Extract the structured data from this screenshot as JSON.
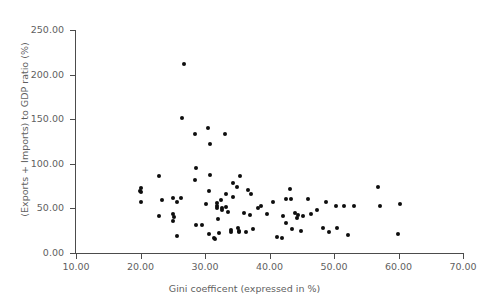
{
  "chart_data": {
    "type": "scatter",
    "title": "",
    "xlabel": "Gini coefficent (expressed in %)",
    "ylabel": "(Exports + Imports) to GDP ratio (%)",
    "xlim": [
      10.0,
      70.0
    ],
    "ylim": [
      0.0,
      250.0
    ],
    "xticks": [
      10.0,
      20.0,
      30.0,
      40.0,
      50.0,
      60.0,
      70.0
    ],
    "yticks": [
      0.0,
      50.0,
      100.0,
      150.0,
      200.0,
      250.0
    ],
    "xtick_labels": [
      "10.00",
      "20.00",
      "30.00",
      "40.00",
      "50.00",
      "60.00",
      "70.00"
    ],
    "ytick_labels": [
      "0.00",
      "50.00",
      "100.00",
      "150.00",
      "200.00",
      "250.00"
    ],
    "grid": false,
    "legend": false,
    "marker": "filled-circle",
    "marker_color": "#0d0d0d",
    "axis_color": "#4c4c4c",
    "text_color": "#5f5f5f",
    "background_color": "#ffffff",
    "n_points": 88,
    "points": [
      {
        "x": 19.9,
        "y": 70.0
      },
      {
        "x": 20.0,
        "y": 72.5
      },
      {
        "x": 20.1,
        "y": 68.0
      },
      {
        "x": 20.1,
        "y": 57.5
      },
      {
        "x": 22.9,
        "y": 86.5
      },
      {
        "x": 22.8,
        "y": 41.5
      },
      {
        "x": 25.0,
        "y": 62.0
      },
      {
        "x": 25.1,
        "y": 44.0
      },
      {
        "x": 25.2,
        "y": 40.5
      },
      {
        "x": 25.1,
        "y": 36.0
      },
      {
        "x": 25.6,
        "y": 18.5
      },
      {
        "x": 25.7,
        "y": 57.0
      },
      {
        "x": 26.8,
        "y": 212.0
      },
      {
        "x": 26.5,
        "y": 151.5
      },
      {
        "x": 28.5,
        "y": 133.0
      },
      {
        "x": 28.6,
        "y": 95.5
      },
      {
        "x": 28.4,
        "y": 81.5
      },
      {
        "x": 28.6,
        "y": 31.5
      },
      {
        "x": 29.6,
        "y": 31.5
      },
      {
        "x": 30.5,
        "y": 140.0
      },
      {
        "x": 30.8,
        "y": 122.0
      },
      {
        "x": 30.7,
        "y": 87.0
      },
      {
        "x": 30.6,
        "y": 69.5
      },
      {
        "x": 30.6,
        "y": 21.0
      },
      {
        "x": 31.4,
        "y": 17.0
      },
      {
        "x": 31.6,
        "y": 15.5
      },
      {
        "x": 31.9,
        "y": 56.0
      },
      {
        "x": 31.9,
        "y": 52.5
      },
      {
        "x": 31.8,
        "y": 51.0
      },
      {
        "x": 32.0,
        "y": 38.0
      },
      {
        "x": 32.1,
        "y": 22.5
      },
      {
        "x": 32.5,
        "y": 59.0
      },
      {
        "x": 32.6,
        "y": 50.5
      },
      {
        "x": 32.7,
        "y": 48.5
      },
      {
        "x": 33.1,
        "y": 133.0
      },
      {
        "x": 33.2,
        "y": 66.5
      },
      {
        "x": 33.3,
        "y": 52.0
      },
      {
        "x": 34.0,
        "y": 25.5
      },
      {
        "x": 34.1,
        "y": 23.0
      },
      {
        "x": 34.3,
        "y": 79.0
      },
      {
        "x": 34.4,
        "y": 62.5
      },
      {
        "x": 35.0,
        "y": 73.5
      },
      {
        "x": 35.1,
        "y": 28.0
      },
      {
        "x": 35.2,
        "y": 24.5
      },
      {
        "x": 35.3,
        "y": 23.5
      },
      {
        "x": 35.5,
        "y": 86.5
      },
      {
        "x": 36.0,
        "y": 44.5
      },
      {
        "x": 36.3,
        "y": 23.0
      },
      {
        "x": 36.9,
        "y": 42.5
      },
      {
        "x": 37.2,
        "y": 66.0
      },
      {
        "x": 37.5,
        "y": 26.5
      },
      {
        "x": 38.7,
        "y": 53.0
      },
      {
        "x": 39.6,
        "y": 43.5
      },
      {
        "x": 40.6,
        "y": 57.0
      },
      {
        "x": 41.2,
        "y": 17.5
      },
      {
        "x": 41.9,
        "y": 17.0
      },
      {
        "x": 42.1,
        "y": 42.0
      },
      {
        "x": 42.5,
        "y": 61.0
      },
      {
        "x": 42.6,
        "y": 33.5
      },
      {
        "x": 43.2,
        "y": 71.5
      },
      {
        "x": 43.3,
        "y": 60.5
      },
      {
        "x": 43.5,
        "y": 27.0
      },
      {
        "x": 43.9,
        "y": 45.0
      },
      {
        "x": 44.3,
        "y": 39.5
      },
      {
        "x": 44.4,
        "y": 43.0
      },
      {
        "x": 44.9,
        "y": 25.0
      },
      {
        "x": 45.2,
        "y": 41.5
      },
      {
        "x": 45.9,
        "y": 61.0
      },
      {
        "x": 46.4,
        "y": 44.0
      },
      {
        "x": 47.4,
        "y": 48.0
      },
      {
        "x": 48.3,
        "y": 27.5
      },
      {
        "x": 48.7,
        "y": 57.0
      },
      {
        "x": 49.3,
        "y": 23.5
      },
      {
        "x": 50.3,
        "y": 53.0
      },
      {
        "x": 50.5,
        "y": 27.5
      },
      {
        "x": 51.6,
        "y": 53.0
      },
      {
        "x": 52.1,
        "y": 20.5
      },
      {
        "x": 53.1,
        "y": 53.0
      },
      {
        "x": 56.8,
        "y": 73.5
      },
      {
        "x": 57.2,
        "y": 52.5
      },
      {
        "x": 59.9,
        "y": 21.0
      },
      {
        "x": 60.3,
        "y": 54.5
      },
      {
        "x": 33.6,
        "y": 46.0
      },
      {
        "x": 36.6,
        "y": 70.5
      },
      {
        "x": 30.2,
        "y": 54.5
      },
      {
        "x": 26.3,
        "y": 62.0
      },
      {
        "x": 23.4,
        "y": 59.0
      },
      {
        "x": 38.2,
        "y": 50.5
      }
    ]
  }
}
